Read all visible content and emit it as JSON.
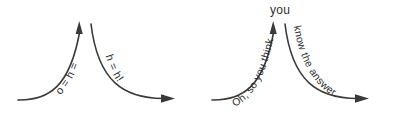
{
  "figure": {
    "background_color": "#ffffff",
    "stroke_color": "#3a3a3a",
    "text_color": "#2e2e2e"
  },
  "panels": [
    {
      "id": "left-panel",
      "name": "garbled-version",
      "ascending_label": "o = h =",
      "descending_label": "h = h!",
      "apex_label": "",
      "arrow_up_name": "up-arrow-icon",
      "arrow_right_name": "right-arrow-icon"
    },
    {
      "id": "right-panel",
      "name": "legible-version",
      "ascending_label": "Oh, so you think",
      "descending_label": "know the answer.",
      "apex_label": "you",
      "arrow_up_name": "up-arrow-icon",
      "arrow_right_name": "right-arrow-icon"
    }
  ]
}
